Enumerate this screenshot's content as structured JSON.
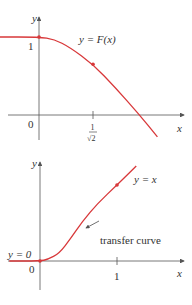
{
  "chart_data": [
    {
      "type": "line",
      "title": "",
      "xlabel": "x",
      "ylabel": "y",
      "curve_label": "y = F(x)",
      "origin_label": "0",
      "y_ticks": [
        {
          "value": 1,
          "label": "1"
        }
      ],
      "x_ticks": [
        {
          "value": 0.7071,
          "label_num": "1",
          "label_den": "√2"
        }
      ],
      "series": [
        {
          "name": "F(x)",
          "color": "#d8383a",
          "x": [
            -0.55,
            0,
            0.2,
            0.4,
            0.7071,
            1.0,
            1.3,
            1.55
          ],
          "y": [
            1,
            1,
            0.97,
            0.87,
            0.65,
            0.35,
            0.02,
            -0.28
          ]
        }
      ],
      "marked_points": [
        {
          "x": 0,
          "y": 1
        },
        {
          "x": 0.7071,
          "y": 0.65
        }
      ]
    },
    {
      "type": "line",
      "title": "",
      "xlabel": "x",
      "ylabel": "y",
      "curve_label": "y = x",
      "annotation": "transfer curve",
      "left_label": "y = 0",
      "origin_label": "0",
      "x_ticks": [
        {
          "value": 1,
          "label": "1"
        }
      ],
      "series": [
        {
          "name": "transfer curve",
          "color": "#d8383a",
          "x": [
            -0.4,
            0,
            0.1,
            0.25,
            0.4,
            0.55,
            0.75,
            1.0,
            1.25
          ],
          "y": [
            0,
            0,
            0.02,
            0.1,
            0.3,
            0.52,
            0.76,
            1.0,
            1.25
          ]
        }
      ],
      "marked_points": [
        {
          "x": 0,
          "y": 0
        },
        {
          "x": 1,
          "y": 1
        }
      ]
    }
  ]
}
